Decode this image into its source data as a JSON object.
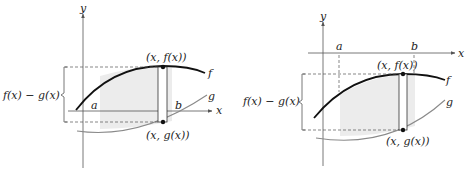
{
  "figures": [
    {
      "id": "left",
      "axis_x_label": "x",
      "axis_y_label": "y",
      "a_label": "a",
      "b_label": "b",
      "f_label": "f",
      "g_label": "g",
      "top_point_label": "(x, f(x))",
      "bottom_point_label": "(x, g(x))",
      "brace_label": "f(x) − g(x)"
    },
    {
      "id": "right",
      "axis_x_label": "x",
      "axis_y_label": "y",
      "a_label": "a",
      "b_label": "b",
      "f_label": "f",
      "g_label": "g",
      "top_point_label": "(x, f(x))",
      "bottom_point_label": "(x, g(x))",
      "brace_label": "f(x) − g(x)"
    }
  ],
  "colors": {
    "f_curve": "#111111",
    "g_curve": "#8a8a8a",
    "shade": "#ececec",
    "axis": "#555555"
  }
}
